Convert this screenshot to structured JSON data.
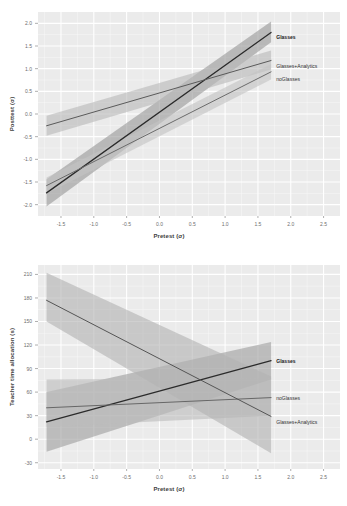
{
  "figure": {
    "background": "#ffffff",
    "panel_background": "#ebebeb",
    "grid_color": "#ffffff"
  },
  "chart_data": [
    {
      "id": "posttest-panel",
      "type": "line",
      "title": "",
      "xlabel": "Pretest (σ)",
      "ylabel": "Posttest (σ)",
      "xlim": [
        -1.85,
        2.75
      ],
      "ylim": [
        -2.25,
        2.25
      ],
      "xticks": [
        -1.5,
        -1.0,
        -0.5,
        0.0,
        0.5,
        1.0,
        1.5,
        2.0,
        2.5
      ],
      "xticklabels": [
        "-1.5",
        "-1.0",
        "-0.5",
        "0.0",
        "0.5",
        "1.0",
        "1.5",
        "2.0",
        "2.5"
      ],
      "yticks": [
        2.0,
        1.5,
        1.0,
        0.5,
        0.0,
        -0.5,
        -1.0,
        -1.5,
        -2.0
      ],
      "yticklabels": [
        "2.0",
        "1.5",
        "1.0",
        "0.5",
        "0.0",
        "-0.5",
        "-1.0",
        "-1.5",
        "-2.0"
      ],
      "grid": true,
      "legend_position": "right-inline",
      "series": [
        {
          "name": "Glasses",
          "color": "#2b2b2b",
          "band_color": "#9a9a9a",
          "x": [
            -1.72,
            1.7
          ],
          "y": [
            -1.74,
            1.8
          ],
          "band_lower": [
            -2.04,
            1.58
          ],
          "band_upper": [
            -1.44,
            2.04
          ],
          "label_x": 1.78,
          "label_y": 1.7,
          "bold": true
        },
        {
          "name": "Glasses+Analytics",
          "color": "#5a5a5a",
          "band_color": "#b9b9b9",
          "x": [
            -1.72,
            1.7
          ],
          "y": [
            -0.26,
            1.18
          ],
          "band_lower": [
            -0.48,
            0.98
          ],
          "band_upper": [
            -0.04,
            1.4
          ],
          "label_x": 1.78,
          "label_y": 1.06,
          "bold": false
        },
        {
          "name": "noGlasses",
          "color": "#6b6b6b",
          "band_color": "#c3c3c3",
          "x": [
            -1.72,
            1.7
          ],
          "y": [
            -1.58,
            0.93
          ],
          "band_lower": [
            -1.76,
            0.76
          ],
          "band_upper": [
            -1.4,
            1.1
          ],
          "label_x": 1.78,
          "label_y": 0.78,
          "bold": false
        }
      ]
    },
    {
      "id": "teacher-time-panel",
      "type": "line",
      "title": "",
      "xlabel": "Pretest (σ)",
      "ylabel": "Teacher time allocation (s)",
      "xlim": [
        -1.85,
        2.75
      ],
      "ylim": [
        -38,
        222
      ],
      "xticks": [
        -1.5,
        -1.0,
        -0.5,
        0.0,
        0.5,
        1.0,
        1.5,
        2.0,
        2.5
      ],
      "xticklabels": [
        "-1.5",
        "-1.0",
        "-0.5",
        "0.0",
        "0.5",
        "1.0",
        "1.5",
        "2.0",
        "2.5"
      ],
      "yticks": [
        210,
        180,
        150,
        120,
        90,
        60,
        30,
        0,
        -30
      ],
      "yticklabels": [
        "210",
        "180",
        "150",
        "120",
        "90",
        "60",
        "30",
        "0",
        "-30"
      ],
      "grid": true,
      "legend_position": "right-inline",
      "series": [
        {
          "name": "Glasses",
          "color": "#2b2b2b",
          "band_color": "#a0a0a0",
          "x": [
            -1.72,
            1.7
          ],
          "y": [
            22,
            100
          ],
          "band_lower": [
            -16,
            76
          ],
          "band_upper": [
            60,
            124
          ],
          "label_x": 1.78,
          "label_y": 100,
          "bold": true
        },
        {
          "name": "noGlasses",
          "color": "#676767",
          "band_color": "#bdbdbd",
          "x": [
            -1.72,
            1.7
          ],
          "y": [
            40,
            53
          ],
          "band_lower": [
            16,
            30
          ],
          "band_upper": [
            76,
            78
          ],
          "label_x": 1.78,
          "label_y": 53,
          "bold": false
        },
        {
          "name": "Glasses+Analytics",
          "color": "#555555",
          "band_color": "#b3b3b3",
          "x": [
            -1.72,
            1.7
          ],
          "y": [
            177,
            29
          ],
          "band_lower": [
            150,
            -18
          ],
          "band_upper": [
            212,
            80
          ],
          "label_x": 1.78,
          "label_y": 22,
          "bold": false
        }
      ]
    }
  ]
}
